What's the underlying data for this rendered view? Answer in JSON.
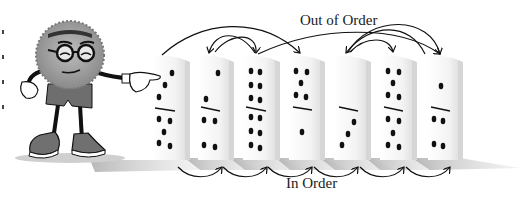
{
  "diagram": {
    "labels": {
      "out_of_order": "Out of Order",
      "in_order": "In Order"
    },
    "character": {
      "description": "cartoon fuzzy ball mascot with headband, round glasses, shorts and sneakers, pointing at first domino"
    },
    "dominoes": [
      {
        "index": 1,
        "top": 3,
        "bottom": 5
      },
      {
        "index": 2,
        "top": 1,
        "bottom": 4
      },
      {
        "index": 3,
        "top": 6,
        "bottom": 6
      },
      {
        "index": 4,
        "top": 5,
        "bottom": 1
      },
      {
        "index": 5,
        "top": 0,
        "bottom": 3
      },
      {
        "index": 6,
        "top": 5,
        "bottom": 5
      },
      {
        "index": 7,
        "top": 1,
        "bottom": 4
      }
    ],
    "out_of_order_arrows": [
      {
        "from": 1,
        "to": 4
      },
      {
        "from": 2,
        "to": 3,
        "bidirectional": true
      },
      {
        "from": 3,
        "to": 7
      },
      {
        "from": 5,
        "to": 6,
        "bidirectional": true
      },
      {
        "from": 6,
        "to": 5
      }
    ],
    "in_order_arrows": [
      {
        "from": 1,
        "to": 2
      },
      {
        "from": 2,
        "to": 3
      },
      {
        "from": 3,
        "to": 4
      },
      {
        "from": 4,
        "to": 5
      },
      {
        "from": 5,
        "to": 6
      },
      {
        "from": 6,
        "to": 7
      }
    ],
    "colors": {
      "ink": "#111111",
      "domino_face": "#f4f4f4",
      "domino_side": "#d6d6d6",
      "shadow": "#bdbdbd",
      "character_fur": "#9a9a9a",
      "shorts": "#6a6a6a"
    }
  }
}
